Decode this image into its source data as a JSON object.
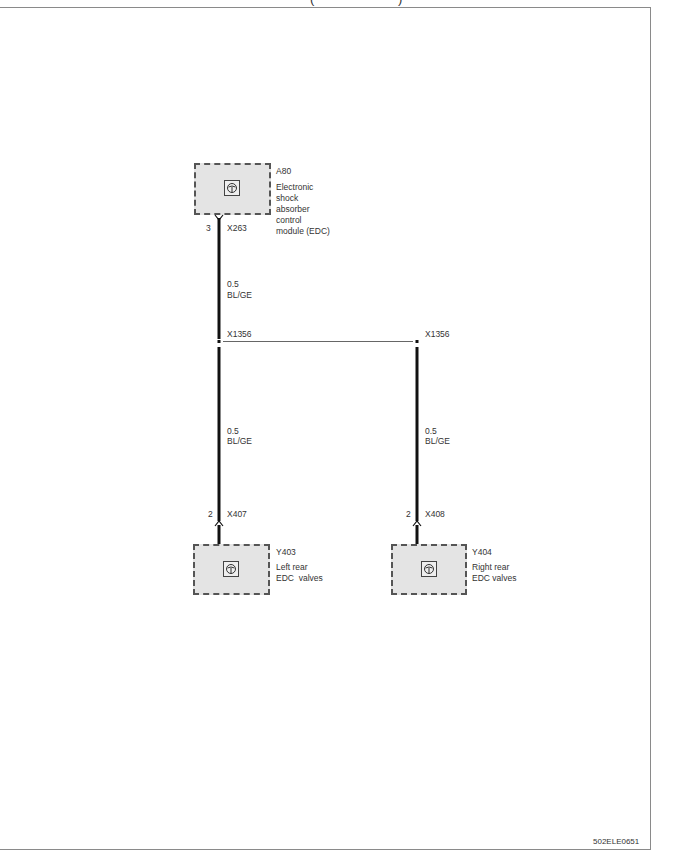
{
  "title_fragment": "( )",
  "drawing_id": "502ELE0651",
  "components": {
    "a80": {
      "ref": "A80",
      "description": "Electronic\nshock\nabsorber\ncontrol\nmodule (EDC)",
      "connector": "X263",
      "pin": "3"
    },
    "y403": {
      "ref": "Y403",
      "description": "Left rear\nEDC  valves",
      "connector": "X407",
      "pin": "2"
    },
    "y404": {
      "ref": "Y404",
      "description": "Right rear\nEDC valves",
      "connector": "X408",
      "pin": "2"
    }
  },
  "splices": {
    "left": "X1356",
    "right": "X1356"
  },
  "wires": {
    "top": {
      "size": "0.5",
      "color": "BL/GE"
    },
    "left": {
      "size": "0.5",
      "color": "BL/GE"
    },
    "right": {
      "size": "0.5",
      "color": "BL/GE"
    }
  },
  "colors": {
    "component_fill": "#e4e4e4",
    "wire": "#111111",
    "frame": "#8a8a8a"
  }
}
